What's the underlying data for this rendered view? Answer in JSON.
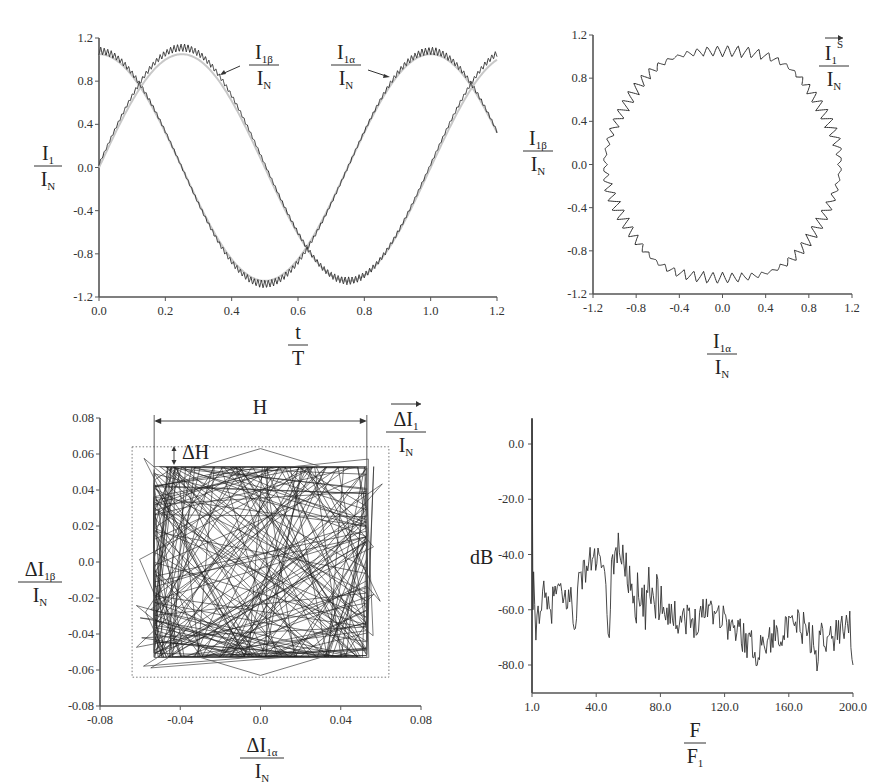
{
  "figure": {
    "panels": [
      "phase-currents-vs-time",
      "current-space-vector-locus",
      "current-error-hysteresis-box",
      "current-harmonic-spectrum"
    ]
  },
  "chart_data": [
    {
      "id": "currents_time",
      "type": "line",
      "title": "",
      "xlabel_num": "t",
      "xlabel_den": "T",
      "ylabel_num": "I",
      "ylabel_num_sub": "1",
      "ylabel_den": "I",
      "ylabel_den_sub": "N",
      "xlim": [
        0.0,
        1.2
      ],
      "ylim": [
        -1.2,
        1.2
      ],
      "xticks": [
        "0.0",
        "0.2",
        "0.4",
        "0.6",
        "0.8",
        "1.0",
        "1.2"
      ],
      "yticks": [
        "1.2",
        "0.8",
        "0.4",
        "0.0",
        "-0.4",
        "-0.8",
        "-1.2"
      ],
      "series": [
        {
          "name": "I1α/IN",
          "shape": "sine",
          "amplitude": 1.08,
          "phase_deg": -90,
          "ripple": 0.05,
          "note": "starts ~0.05 at t=0, peak ~1.08 at t=1.0, min ~-1.08 at t=0.5"
        },
        {
          "name": "I1β/IN",
          "shape": "cosine",
          "amplitude": 1.08,
          "phase_deg": 0,
          "ripple": 0.05,
          "note": "starts ~1.08 at t=0, min ~-1.08 at t=0.75"
        },
        {
          "name": "reference",
          "shape": "ideal sinusoids",
          "color": "#bbbbbb"
        }
      ],
      "annotations": [
        {
          "text_num": "I",
          "text_sub": "1β",
          "text_den": "I",
          "text_den_sub": "N",
          "points_to": "I1β curve near t≈0.37, y≈0.85"
        },
        {
          "text_num": "I",
          "text_sub": "1α",
          "text_den": "I",
          "text_den_sub": "N",
          "points_to": "I1α curve near t≈0.87, y≈0.85"
        }
      ],
      "grid": false
    },
    {
      "id": "space_vector_locus",
      "type": "scatter",
      "xlabel_num": "I",
      "xlabel_num_sub": "1α",
      "xlabel_den": "I",
      "xlabel_den_sub": "N",
      "ylabel_num": "I",
      "ylabel_num_sub": "1β",
      "ylabel_den": "I",
      "ylabel_den_sub": "N",
      "legend_num": "I",
      "legend_num_sub": "1",
      "legend_sup": "S",
      "legend_den": "I",
      "legend_den_sub": "N",
      "xlim": [
        -1.2,
        1.2
      ],
      "ylim": [
        -1.2,
        1.2
      ],
      "xticks": [
        "-1.2",
        "-0.8",
        "-0.4",
        "0.0",
        "0.4",
        "0.8",
        "1.2"
      ],
      "yticks": [
        "1.2",
        "0.8",
        "0.4",
        "0.0",
        "-0.4",
        "-0.8",
        "-1.2"
      ],
      "shape": "approximately circular locus, radius ≈1.08, hexagon-ish flattening, sawtooth ripple",
      "grid": false
    },
    {
      "id": "current_error_box",
      "type": "line",
      "xlabel_num": "ΔI",
      "xlabel_num_sub": "1α",
      "xlabel_den": "I",
      "xlabel_den_sub": "N",
      "ylabel_num": "ΔI",
      "ylabel_num_sub": "1β",
      "ylabel_den": "I",
      "ylabel_den_sub": "N",
      "legend_num": "ΔI",
      "legend_num_sub": "1",
      "legend_den": "I",
      "legend_den_sub": "N",
      "xlim": [
        -0.08,
        0.08
      ],
      "ylim": [
        -0.08,
        0.08
      ],
      "xticks": [
        "-0.08",
        "-0.04",
        "0.0",
        "0.04",
        "0.08"
      ],
      "yticks": [
        "0.08",
        "0.06",
        "0.04",
        "0.02",
        "0.0",
        "-0.02",
        "-0.04",
        "-0.06",
        "-0.08"
      ],
      "hysteresis_band": {
        "x": [
          -0.053,
          0.053
        ],
        "y": [
          -0.053,
          0.053
        ]
      },
      "outer_dotted_box": {
        "x": [
          -0.064,
          0.064
        ],
        "y": [
          -0.064,
          0.064
        ]
      },
      "annotations": [
        {
          "text": "H",
          "meaning": "hysteresis band width, spans -0.053 to 0.053"
        },
        {
          "text": "ΔH",
          "meaning": "overshoot margin between band and dotted box"
        }
      ],
      "grid": false
    },
    {
      "id": "harmonic_spectrum",
      "type": "line",
      "xlabel_num": "F",
      "xlabel_den": "F",
      "xlabel_den_sub": "1",
      "ylabel": "dB",
      "xlim": [
        1.0,
        200.0
      ],
      "ylim": [
        -90,
        10
      ],
      "xticks": [
        "1.0",
        "40.0",
        "80.0",
        "120.0",
        "160.0",
        "200.0"
      ],
      "yticks": [
        "0.0",
        "-20.0",
        "-40.0",
        "-60.0",
        "-80.0"
      ],
      "x": [
        1,
        2,
        3,
        5,
        8,
        12,
        16,
        20,
        25,
        27,
        30,
        35,
        40,
        45,
        49,
        50,
        55,
        57,
        60,
        65,
        70,
        75,
        80,
        85,
        90,
        95,
        100,
        105,
        110,
        115,
        120,
        125,
        130,
        135,
        140,
        145,
        150,
        155,
        160,
        165,
        170,
        175,
        178,
        180,
        185,
        190,
        195,
        198,
        200
      ],
      "values": [
        0,
        -50,
        -70,
        -60,
        -55,
        -62,
        -52,
        -57,
        -55,
        -67,
        -50,
        -44,
        -41,
        -45,
        -70,
        -45,
        -36,
        -42,
        -45,
        -55,
        -62,
        -52,
        -55,
        -60,
        -63,
        -62,
        -65,
        -62,
        -58,
        -60,
        -63,
        -67,
        -68,
        -72,
        -75,
        -72,
        -70,
        -67,
        -68,
        -65,
        -67,
        -71,
        -82,
        -65,
        -72,
        -68,
        -65,
        -63,
        -80
      ],
      "grid": false
    }
  ]
}
